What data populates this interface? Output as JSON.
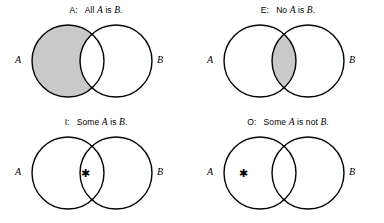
{
  "figure": {
    "background_color": "#ffffff",
    "stroke_color": "#000000",
    "shade_color": "#c9c9c9",
    "set_a_label": "A",
    "set_b_label": "B",
    "star_glyph": "✱"
  },
  "panels": [
    {
      "key": "A",
      "letter": "A:",
      "title_prefix": "All",
      "title_middle": "is",
      "title_suffix": ".",
      "subject": "A",
      "predicate": "B",
      "full_title": "A:  All A is B.",
      "shaded_region": "a-only",
      "star_region": "none"
    },
    {
      "key": "E",
      "letter": "E:",
      "title_prefix": "No",
      "title_middle": "is",
      "title_suffix": ".",
      "subject": "A",
      "predicate": "B",
      "full_title": "E:  No A is B.",
      "shaded_region": "intersection",
      "star_region": "none"
    },
    {
      "key": "I",
      "letter": "I:",
      "title_prefix": "Some",
      "title_middle": "is",
      "title_suffix": ".",
      "subject": "A",
      "predicate": "B",
      "full_title": "I:  Some A is B.",
      "shaded_region": "none",
      "star_region": "intersection"
    },
    {
      "key": "O",
      "letter": "O:",
      "title_prefix": "Some",
      "title_middle": "is not",
      "title_suffix": ".",
      "subject": "A",
      "predicate": "B",
      "full_title": "O:  Some A is not B.",
      "shaded_region": "none",
      "star_region": "a-only"
    }
  ]
}
